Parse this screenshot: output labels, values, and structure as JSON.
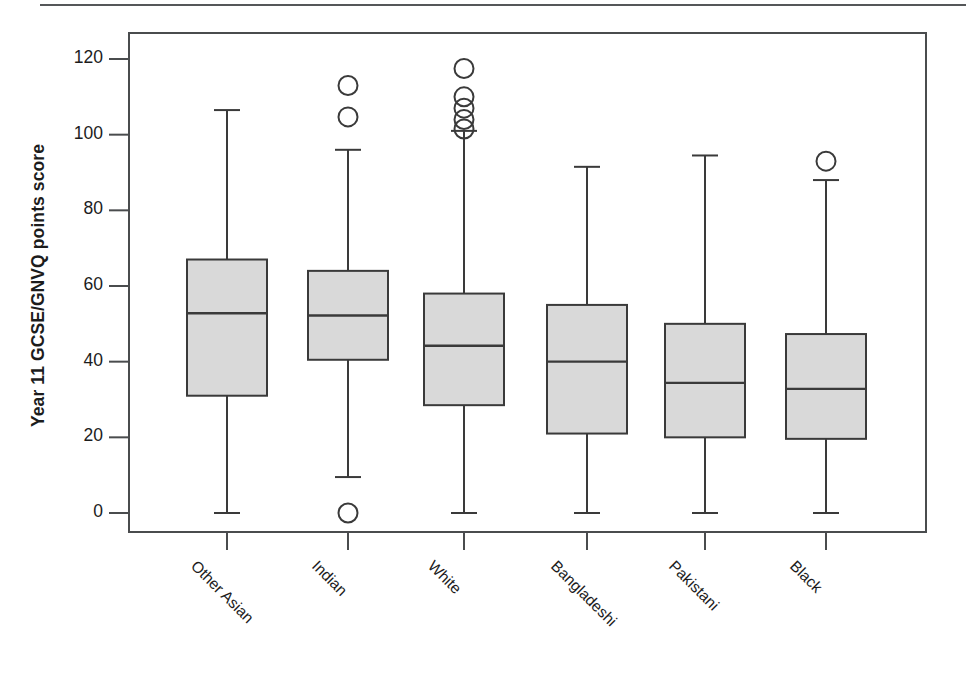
{
  "chart_data": {
    "type": "box",
    "title": "",
    "xlabel": "",
    "ylabel": "Year 11 GCSE/GNVQ points score",
    "ylim": [
      -4,
      125
    ],
    "yticks": [
      0,
      20,
      40,
      60,
      80,
      100,
      120
    ],
    "ytick_labels": [
      "0",
      "20",
      "40",
      "60",
      "80",
      "100",
      "120"
    ],
    "grid": false,
    "legend": "none",
    "categories": [
      "Other Asian",
      "Indian",
      "White",
      "Bangladeshi",
      "Pakistani",
      "Black"
    ],
    "boxes": [
      {
        "category": "Other Asian",
        "whisker_low": 0,
        "q1": 31,
        "median": 52.8,
        "q3": 67,
        "whisker_high": 106.5,
        "outliers": []
      },
      {
        "category": "Indian",
        "whisker_low": 9.5,
        "q1": 40.5,
        "median": 52.2,
        "q3": 64,
        "whisker_high": 96,
        "outliers": [
          113,
          104.7,
          0
        ]
      },
      {
        "category": "White",
        "whisker_low": 0,
        "q1": 28.5,
        "median": 44.2,
        "q3": 58,
        "whisker_high": 101,
        "outliers": [
          117.5,
          110,
          107,
          104,
          101.5
        ]
      },
      {
        "category": "Bangladeshi",
        "whisker_low": 0,
        "q1": 21,
        "median": 40,
        "q3": 55,
        "whisker_high": 91.5,
        "outliers": []
      },
      {
        "category": "Pakistani",
        "whisker_low": 0,
        "q1": 20,
        "median": 34.4,
        "q3": 50,
        "whisker_high": 94.5,
        "outliers": []
      },
      {
        "category": "Black",
        "whisker_low": 0,
        "q1": 19.6,
        "median": 32.8,
        "q3": 47.3,
        "whisker_high": 88,
        "outliers": [
          93
        ]
      }
    ],
    "colors": {
      "box_fill": "#d9d9d9",
      "line": "#3a3a3a",
      "frame": "#4a4c4e",
      "text": "#1c1c1c"
    }
  }
}
